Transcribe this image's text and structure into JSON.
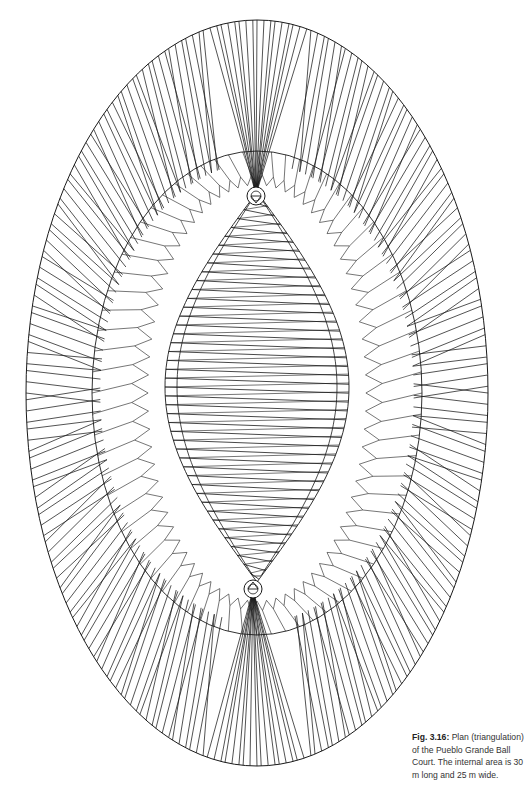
{
  "figure": {
    "title": "Plan (triangulation) of the Pueblo Grande Ball Court",
    "stroke_color": "#1a1a1a",
    "background": "#ffffff",
    "outer_ellipse": {
      "cx": 257,
      "cy": 393,
      "rx": 231,
      "ry": 373
    },
    "middle_ring": {
      "cx": 257,
      "cy": 393,
      "rx": 165,
      "ry": 242
    },
    "inner_lens": {
      "cx": 257,
      "top": 192,
      "bottom": 582,
      "half_width": 92
    },
    "end_markers": [
      {
        "cx": 256,
        "cy": 196,
        "r": 9
      },
      {
        "cx": 253,
        "cy": 589,
        "r": 9
      }
    ]
  },
  "caption": {
    "label": "Fig. 3.16:",
    "text": " Plan (triangulation) of the Pueblo Grande Ball Court. The internal area is 30 m long and 25 m wide.",
    "length_m": 30,
    "width_m": 25
  }
}
